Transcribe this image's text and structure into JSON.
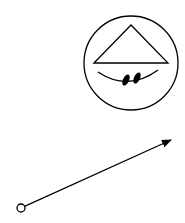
{
  "diagram": {
    "background": "#ffffff",
    "stroke_color": "#000000",
    "symbol": {
      "name": "circle-with-triangle-and-smile",
      "circle": {
        "cx": 131,
        "cy": 63,
        "r": 47
      },
      "triangle": {
        "points": "94,63 131,25 168,63"
      },
      "smile_arc": {
        "d": "M 98 72 Q 128 92 158 70"
      },
      "hash_marks": [
        {
          "cx": 127,
          "cy": 80,
          "rx": 3,
          "ry": 6
        },
        {
          "cx": 138,
          "cy": 78,
          "rx": 3,
          "ry": 6
        }
      ]
    },
    "arrow": {
      "start": {
        "x": 21,
        "y": 208
      },
      "end": {
        "x": 171,
        "y": 140
      },
      "start_marker": "open-circle",
      "end_marker": "filled-arrowhead"
    }
  }
}
